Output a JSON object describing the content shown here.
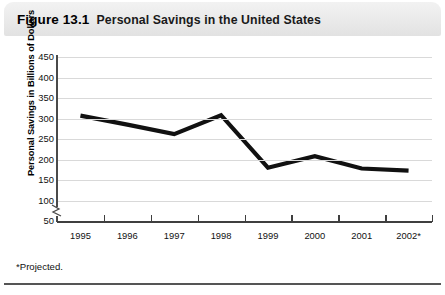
{
  "figure": {
    "number_label": "Figure 13.1",
    "title": "Personal Savings in the United States",
    "footnote": "*Projected."
  },
  "chart_data": {
    "type": "line",
    "title": "Personal Savings in the United States",
    "xlabel": "",
    "ylabel": "Personal Savings in Billions of Dollars",
    "categories": [
      "1995",
      "1996",
      "1997",
      "1998",
      "1999",
      "2000",
      "2001",
      "2002*"
    ],
    "values": [
      307,
      285,
      262,
      308,
      180,
      208,
      178,
      173
    ],
    "series": [
      {
        "name": "Personal Savings",
        "values": [
          307,
          285,
          262,
          308,
          180,
          208,
          178,
          173
        ]
      }
    ],
    "ylim": [
      50,
      450
    ],
    "ytick_labels": [
      "450",
      "400",
      "350",
      "300",
      "250",
      "200",
      "150",
      "100",
      "50"
    ],
    "ytick_values": [
      450,
      400,
      350,
      300,
      250,
      200,
      150,
      100,
      50
    ],
    "axis_break": true,
    "axis_break_between": [
      50,
      100
    ],
    "grid": true,
    "grid_axis": "y",
    "legend": false,
    "line_color": "#111111",
    "grid_color": "#d9d9d9",
    "axis_color": "#3f3f3f",
    "annotations": [
      "*Projected."
    ]
  }
}
